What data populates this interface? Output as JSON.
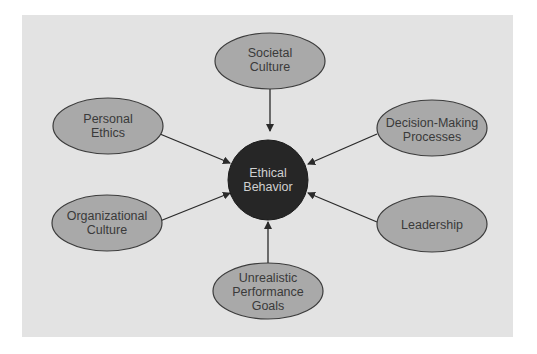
{
  "diagram": {
    "center": {
      "line1": "Ethical",
      "line2": "Behavior"
    },
    "nodes": {
      "societal_culture": {
        "line1": "Societal",
        "line2": "Culture"
      },
      "personal_ethics": {
        "line1": "Personal",
        "line2": "Ethics"
      },
      "decision_making": {
        "line1": "Decision-Making",
        "line2": "Processes"
      },
      "organizational_culture": {
        "line1": "Organizational",
        "line2": "Culture"
      },
      "leadership": {
        "line1": "Leadership"
      },
      "performance_goals": {
        "line1": "Unrealistic",
        "line2": "Performance",
        "line3": "Goals"
      }
    },
    "colors": {
      "background": "#e3e3e3",
      "node_fill": "#a9a9a9",
      "node_stroke": "#3c3c3c",
      "center_fill": "#262626",
      "arrow": "#2a2a2a"
    }
  }
}
